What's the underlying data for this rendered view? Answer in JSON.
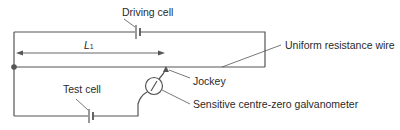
{
  "diagram": {
    "labels": {
      "driving_cell": "Driving cell",
      "length": "L",
      "length_sub": "1",
      "resistance_wire": "Uniform resistance wire",
      "test_cell": "Test cell",
      "jockey": "Jockey",
      "galvanometer": "Sensitive centre-zero galvanometer"
    },
    "colors": {
      "wire": "#555555",
      "text": "#2a2a2a",
      "background": "#ffffff"
    }
  }
}
